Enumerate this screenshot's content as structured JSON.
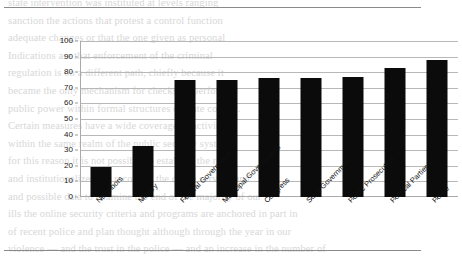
{
  "page": {
    "ghost_text_lines": [
      "state intervention was instituted at levels ranging",
      "sanction the actions that protest a control function",
      "adequate changes or that the one given as personal",
      "Indications are that enforcement of the criminal",
      "regulation is on a different path, chiefly because it",
      "became the only mechanism for checks on performed",
      "public power within formal structures of state control.",
      "Certain measures have a wide coverage of activities",
      "within the same realm of the public security system",
      "for this reason it is not possible to establish the real",
      "and institutionalized the record of the crime surveys and",
      "and possible data to examine the end of the majority of our",
      "ills the online security criteria and programs are anchored in part in",
      "of recent police and plan thought although through the year in our",
      "violence — and the trust in the police — and an increase in the number of"
    ],
    "rules": {
      "top_rule": "page-rule-top",
      "bottom_rule": "page-rule-bottom"
    }
  },
  "chart_data": {
    "type": "bar",
    "title": "",
    "subtitle": "",
    "xlabel": "",
    "ylabel": "",
    "ylim": [
      0,
      100
    ],
    "ytick_step": 10,
    "grid": true,
    "legend": "none",
    "orientation": "vertical",
    "bar_color": "#0b0b0b",
    "categories": [
      "Neighbors",
      "Military",
      "Federal Government",
      "Municipal Governments",
      "Congress",
      "State Government",
      "Public Prosecutors",
      "Political Parties",
      "Police"
    ],
    "values": [
      19,
      33,
      75,
      75,
      76,
      76,
      77,
      83,
      88
    ],
    "ytick_labels": [
      "0",
      "10",
      "20",
      "30",
      "40",
      "50",
      "60",
      "70",
      "80",
      "90",
      "100"
    ],
    "xtick_label_rotation_deg": -45
  }
}
